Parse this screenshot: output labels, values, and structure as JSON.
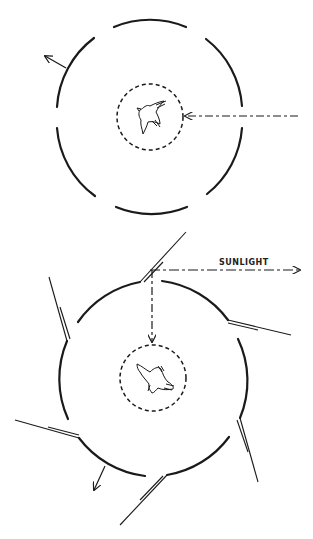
{
  "diagram": {
    "top_panel": {
      "description": "Bird inside dashed inner circle surrounded by segmented outer ring; dashed arrow from right points to bird; arrow exits ring at upper-left",
      "arrows": [
        "incoming-dashed-arrow-right",
        "outgoing-arrow-upper-left"
      ]
    },
    "bottom_panel": {
      "sunlight_label": "SUNLIGHT",
      "description": "Segmented outer ring with six angled mirrors at gaps; sunlight ray reflected by top mirror down to bird in dashed inner circle; arrow exits ring at lower-left",
      "mirror_count": 6
    },
    "colors": {
      "ink": "#1a1a1a",
      "background": "#ffffff"
    }
  }
}
